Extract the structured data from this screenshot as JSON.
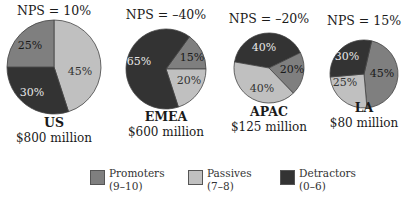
{
  "chart_data": {
    "type": "pie",
    "title": "",
    "legend": {
      "position": "bottom",
      "entries": [
        {
          "name": "Promoters",
          "range": "(9–10)",
          "color": "#7f7f7f"
        },
        {
          "name": "Passives",
          "range": "(7–8)",
          "color": "#c0c0c0"
        },
        {
          "name": "Detractors",
          "range": "(0–6)",
          "color": "#333333"
        }
      ]
    },
    "pies": [
      {
        "region": "US",
        "revenue": "$800 million",
        "nps_label": "NPS = 10%",
        "nps": 10,
        "slices": {
          "Promoters": 25,
          "Passives": 45,
          "Detractors": 30
        }
      },
      {
        "region": "EMEA",
        "revenue": "$600 million",
        "nps_label": "NPS = –40%",
        "nps": -40,
        "slices": {
          "Promoters": 15,
          "Passives": 20,
          "Detractors": 65
        }
      },
      {
        "region": "APAC",
        "revenue": "$125 million",
        "nps_label": "NPS = –20%",
        "nps": -20,
        "slices": {
          "Promoters": 20,
          "Passives": 40,
          "Detractors": 40
        }
      },
      {
        "region": "LA",
        "revenue": "$80 million",
        "nps_label": "NPS = 15%",
        "nps": 15,
        "slices": {
          "Promoters": 45,
          "Passives": 25,
          "Detractors": 30
        }
      }
    ]
  },
  "layout": {
    "pies": [
      {
        "cx": 54,
        "cy": 67,
        "r": 47,
        "title_y": 15,
        "name_y": 127,
        "rev_y": 142,
        "order": [
          [
            "Passives",
            0
          ],
          [
            "Detractors",
            162
          ],
          [
            "Promoters",
            270
          ]
        ],
        "labels": {
          "Promoters": [
            30,
            46
          ],
          "Passives": [
            80,
            72
          ],
          "Detractors": [
            32,
            93
          ]
        }
      },
      {
        "cx": 166,
        "cy": 69,
        "r": 40,
        "title_y": 19,
        "name_y": 121,
        "rev_y": 136,
        "order": [
          [
            "Promoters",
            36
          ],
          [
            "Passives",
            90
          ],
          [
            "Detractors",
            162
          ]
        ],
        "labels": {
          "Promoters": [
            192,
            58
          ],
          "Passives": [
            189,
            81
          ],
          "Detractors": [
            139,
            62
          ]
        }
      },
      {
        "cx": 269,
        "cy": 68,
        "r": 35,
        "title_y": 23,
        "name_y": 116,
        "rev_y": 131,
        "order": [
          [
            "Detractors",
            280
          ],
          [
            "Promoters",
            64
          ],
          [
            "Passives",
            136
          ]
        ],
        "labels": {
          "Promoters": [
            292,
            70
          ],
          "Passives": [
            262,
            89
          ],
          "Detractors": [
            264,
            48
          ]
        }
      },
      {
        "cx": 364,
        "cy": 74,
        "r": 34,
        "title_y": 25,
        "name_y": 112,
        "rev_y": 127,
        "order": [
          [
            "Promoters",
            13
          ],
          [
            "Passives",
            175
          ],
          [
            "Detractors",
            265
          ]
        ],
        "labels": {
          "Promoters": [
            382,
            74
          ],
          "Passives": [
            345,
            83
          ],
          "Detractors": [
            347,
            57
          ]
        }
      }
    ],
    "label_colors": {
      "Promoters": "#1a1a1a",
      "Passives": "#333333",
      "Detractors": "#e8e8e8"
    }
  }
}
